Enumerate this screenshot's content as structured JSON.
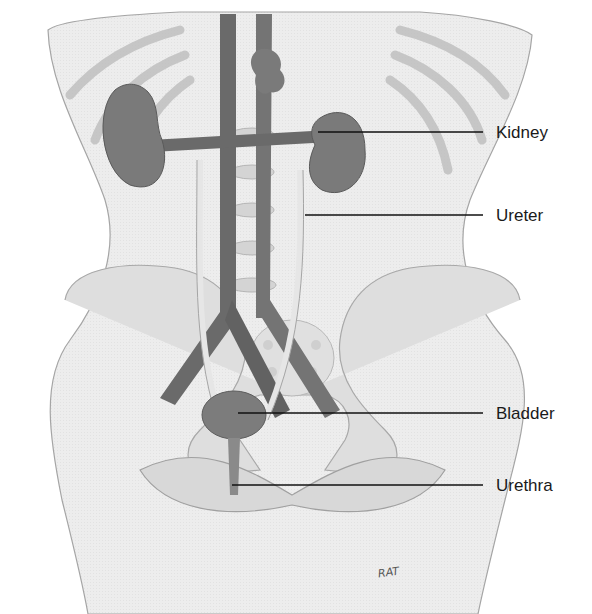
{
  "figure": {
    "labels": [
      {
        "id": "kidney",
        "text": "Kidney"
      },
      {
        "id": "ureter",
        "text": "Ureter"
      },
      {
        "id": "bladder",
        "text": "Bladder"
      },
      {
        "id": "urethra",
        "text": "Urethra"
      }
    ],
    "signature": "RAT"
  },
  "colors": {
    "background": "#ffffff",
    "skin": "#ececec",
    "skin_outline": "#9a9a9a",
    "bone": "#dcdcdc",
    "bone_shadow": "#c4c4c4",
    "vessel": "#6e6e6e",
    "vessel_dark": "#555555",
    "organ": "#7a7a7a",
    "ureter": "#e4e4e4",
    "leader_line": "#111111",
    "label_text": "#1a1a1a"
  }
}
